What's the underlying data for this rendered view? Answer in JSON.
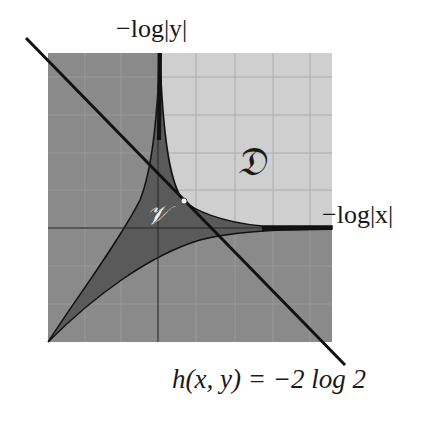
{
  "figure": {
    "type": "amoeba-diagram",
    "labels": {
      "y_axis": "−log|y|",
      "x_axis": "−log|x|",
      "line": "h(x, y) = −2 log 2",
      "region_D": "𝔇",
      "region_V": "𝒱"
    },
    "colors": {
      "background": "#ffffff",
      "dark_region": "#8a8a8a",
      "light_region": "#cfcfcf",
      "amoeba_fill": "#5c5c5c",
      "curve": "#111111",
      "grid": "#a8a8a8",
      "point": "#ffffff"
    },
    "geometry": {
      "square": {
        "x0": 48,
        "y0": 53,
        "x1": 332,
        "y1": 342
      },
      "axis_x_y": 228,
      "axis_y_x": 158,
      "line": {
        "x0": 26,
        "y0": 38,
        "x1": 345,
        "y1": 365
      },
      "grid_x": [
        85,
        121,
        196,
        235,
        273,
        310
      ],
      "grid_y": [
        77,
        115,
        153,
        190,
        266,
        304
      ],
      "marked_point": {
        "x": 184,
        "y": 201
      }
    }
  }
}
